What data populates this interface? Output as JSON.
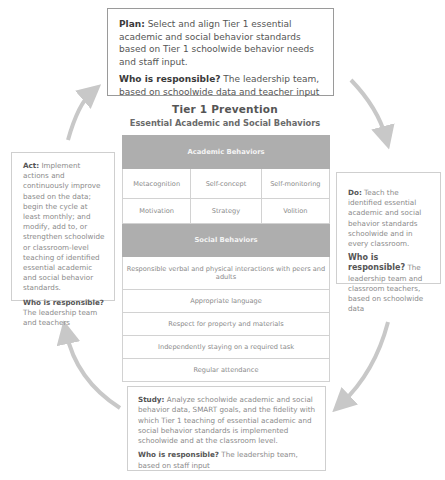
{
  "plan": {
    "label": "Plan:",
    "text": " Select and align Tier 1 essential academic and social behavior standards based on Tier 1 schoolwide behavior needs and staff input.",
    "responsible_label": "Who is responsible?",
    "responsible_text": " The leadership team, based on schoolwide data and teacher input"
  },
  "center": {
    "title": "Tier 1 Prevention",
    "subtitle": "Essential Academic and Social Behaviors",
    "academic_header": "Academic Behaviors",
    "academic_items": [
      [
        "Metacognition",
        "Self-concept",
        "Self-monitoring"
      ],
      [
        "Motivation",
        "Strategy",
        "Volition"
      ]
    ],
    "social_header": "Social Behaviors",
    "social_items": [
      "Responsible verbal and physical interactions with peers and adults",
      "Appropriate language",
      "Respect for property and materials",
      "Independently staying on a required task",
      "Regular attendance"
    ]
  },
  "act": {
    "label": "Act:",
    "text": " Implement actions and continuously improve based on the data; begin the cycle at least monthly; and modify, add to, or strengthen schoolwide or classroom-level teaching of identified essential academic and social behavior standards.",
    "responsible_label": "Who is responsible?",
    "responsible_text": " The leadership team and teachers"
  },
  "do": {
    "label": "Do:",
    "text": " Teach the identified essential academic and social behavior standards schoolwide and in every classroom.",
    "responsible_label": "Who is responsible?",
    "responsible_text": " The leadership team and classroom teachers, based on schoolwide data"
  },
  "study": {
    "label": "Study:",
    "text": " Analyze schoolwide academic and social behavior data, SMART goals, and the fidelity with which Tier 1 teaching of essential academic and social behavior standards is implemented schoolwide and at the classroom level.",
    "responsible_label": "Who is responsible?",
    "responsible_text": " The leadership team, based on staff input"
  },
  "colors": {
    "arrow": "#c8c8c8",
    "table_header_bg": "#aeaeae",
    "table_header_text": "#f4f4f4",
    "box_border": "#cfcfcf",
    "plan_border": "#9a9a9a"
  }
}
